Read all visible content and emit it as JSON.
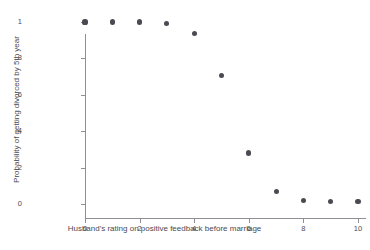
{
  "chart_data": {
    "type": "scatter",
    "title": "",
    "xlabel": "Husband's rating on positive feedback before marriage",
    "ylabel": "Probability of getting divorced by 5th year",
    "xlim": [
      0,
      10
    ],
    "ylim": [
      0,
      1
    ],
    "grid": false,
    "legend": null,
    "marker_color": "#4a4a52",
    "axis_color": "#8e8e96",
    "background_color": "#ffffff",
    "xticks": [
      {
        "value": 0,
        "label": "0"
      },
      {
        "value": 2,
        "label": "2"
      },
      {
        "value": 4,
        "label": "4"
      },
      {
        "value": 6,
        "label": "6"
      },
      {
        "value": 8,
        "label": "8"
      },
      {
        "value": 10,
        "label": "10"
      }
    ],
    "yticks": [
      {
        "value": 1,
        "label": "1"
      },
      {
        "value": 0.8,
        "label": ".8"
      },
      {
        "value": 0.6,
        "label": ".6"
      },
      {
        "value": 0.4,
        "label": ".4"
      },
      {
        "value": 0.2,
        "label": ".2"
      },
      {
        "value": 0,
        "label": "0"
      }
    ],
    "x": [
      0,
      1,
      2,
      3,
      4,
      5,
      6,
      7,
      8,
      9,
      10
    ],
    "y": [
      1.0,
      1.0,
      1.0,
      0.99,
      0.935,
      0.705,
      0.28,
      0.07,
      0.02,
      0.015,
      0.015
    ],
    "points": [
      {
        "x": 0,
        "y": 1.0
      },
      {
        "x": 1,
        "y": 1.0
      },
      {
        "x": 2,
        "y": 1.0
      },
      {
        "x": 3,
        "y": 0.99
      },
      {
        "x": 4,
        "y": 0.935
      },
      {
        "x": 5,
        "y": 0.705
      },
      {
        "x": 6,
        "y": 0.28
      },
      {
        "x": 7,
        "y": 0.07
      },
      {
        "x": 8,
        "y": 0.02
      },
      {
        "x": 9,
        "y": 0.015
      },
      {
        "x": 10,
        "y": 0.015
      }
    ]
  }
}
